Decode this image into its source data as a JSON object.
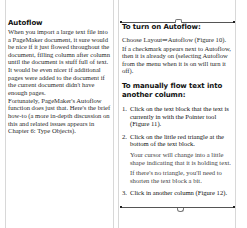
{
  "left_column": {
    "heading": "Autoflow",
    "paragraphs": [
      "When you import a large text file into a PageMaker document, it sure would be nice if it just flowed throughout the document, filling column after column until the document is stuff full of text. It would be even nicer if additional pages were added to the document if the current document didn't have enough pages.",
      "Fortunately, PageMaker's Autoflow function does just that. Here's the brief how-to (a more in-depth discussion on this and related issues appears in Chapter 6: Type Objects)."
    ]
  },
  "right_column": {
    "heading": "To turn on Autoflow:",
    "instruction": "Choose Layout⇒Autoflow (Figure 10).",
    "instruction_note": "If a checkmark appears next to Autoflow, then it is already on (selecting Autoflow from the menu when it is on will turn it off).",
    "subheading": "To manually flow text into another column:",
    "steps": [
      {
        "num": "1.",
        "text": "Click on the text block that the text is currently in with the Pointer tool (Figure 11).",
        "notes": []
      },
      {
        "num": "2.",
        "text": "Click on the little red triangle at the bottom of the text block.",
        "notes": [
          "Your cursor will change into a little shape indicating that it is holding text.",
          "If there's no triangle, you'll need to shorten the text block a bit."
        ]
      },
      {
        "num": "3.",
        "text": "Click in another column (Figure 12).",
        "notes": []
      }
    ]
  },
  "colors": {
    "guide": "#d8d8d8",
    "text_block_border": "#555555",
    "text": "#222222"
  }
}
